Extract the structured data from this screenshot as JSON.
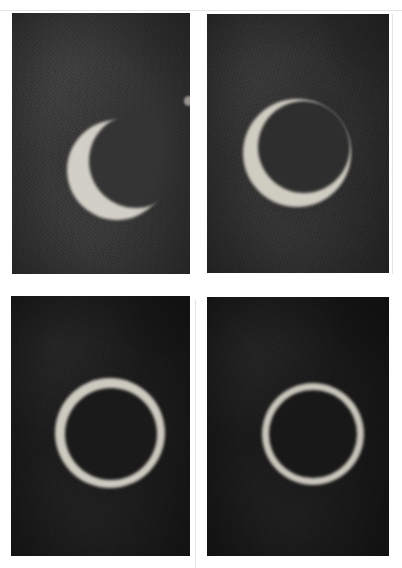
{
  "figure": {
    "kind": "photographic-plate",
    "canvas": {
      "width": 402,
      "height": 568,
      "background": "#ffffff"
    },
    "layout": {
      "rows": 2,
      "columns": 2,
      "panel_count": 4
    }
  },
  "palette": {
    "paper": "#ffffff",
    "seam_line": "#e4e4e4",
    "sky_light": "#3a3a3a",
    "sky_mid": "#303030",
    "sky_dark": "#1d1d1d",
    "sky_darkest": "#161616",
    "solar_bright": "#d2cfc6",
    "solar_dim": "#b8b5ac"
  },
  "panels": [
    {
      "id": "panel-top-left",
      "position": "top-left",
      "phase_label": "thick crescent",
      "frame": {
        "x": 12,
        "y": 13,
        "width": 178,
        "height": 261
      },
      "sky_color": "#383838",
      "solar": {
        "shape": "crescent",
        "center_x": 105,
        "center_y": 157,
        "radius": 50,
        "color": "#d2cfc6",
        "occulter": {
          "offset_x": 19,
          "offset_y": -9,
          "radius": 47,
          "color": "#343434"
        }
      },
      "artifacts": [
        {
          "name": "emulsion-speck",
          "x": 172,
          "y": 83,
          "width": 9,
          "height": 10
        }
      ]
    },
    {
      "id": "panel-top-right",
      "position": "top-right",
      "phase_label": "near-annular ring, broken at upper right",
      "frame": {
        "x": 207,
        "y": 14,
        "width": 182,
        "height": 259
      },
      "sky_color": "#313131",
      "solar": {
        "shape": "annulus",
        "center_x": 90,
        "center_y": 139,
        "radius": 54,
        "color": "#cfccc2",
        "occulter": {
          "offset_x": 7,
          "offset_y": -6,
          "radius": 46,
          "color": "#2e2e2e"
        }
      },
      "artifacts": []
    },
    {
      "id": "panel-bottom-left",
      "position": "bottom-left",
      "phase_label": "annular ring, maximum",
      "frame": {
        "x": 11,
        "y": 296,
        "width": 179,
        "height": 260
      },
      "sky_color": "#1c1c1c",
      "solar": {
        "shape": "annulus",
        "center_x": 99,
        "center_y": 137,
        "radius": 55,
        "color": "#cdcac0",
        "occulter": {
          "offset_x": 1,
          "offset_y": 1,
          "radius": 46,
          "color": "#1a1a1a"
        }
      },
      "artifacts": []
    },
    {
      "id": "panel-bottom-right",
      "position": "bottom-right",
      "phase_label": "annular ring, thin",
      "frame": {
        "x": 207,
        "y": 297,
        "width": 182,
        "height": 259
      },
      "sky_color": "#1a1a1a",
      "solar": {
        "shape": "annulus",
        "center_x": 106,
        "center_y": 137,
        "radius": 51,
        "color": "#c9c6bc",
        "occulter": {
          "offset_x": 0,
          "offset_y": 0,
          "radius": 44,
          "color": "#181818"
        }
      },
      "artifacts": []
    }
  ],
  "seams": [
    {
      "name": "seam-vertical-gutter",
      "orientation": "v",
      "x": 195,
      "y": 300,
      "length": 268
    },
    {
      "name": "seam-vertical-right",
      "orientation": "v",
      "x": 392,
      "y": 14,
      "length": 260
    },
    {
      "name": "seam-horizontal-top",
      "orientation": "h",
      "x": 0,
      "y": 10,
      "length": 402
    }
  ]
}
